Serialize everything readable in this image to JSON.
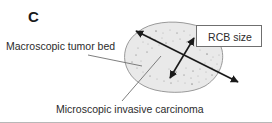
{
  "figure": {
    "panel_letter": "C",
    "labels": {
      "macroscopic": "Macroscopic tumor bed",
      "microscopic": "Microscopic invasive carcinoma",
      "rcb_size": "RCB size"
    },
    "colors": {
      "text": "#2b2b2b",
      "panel_letter": "#1a1a1a",
      "tumor_bed_fill": "#e8e8e8",
      "tumor_bed_stroke": "#9a9a9a",
      "arrow": "#1a1a1a",
      "leader_line": "#777777",
      "box_border": "#6f6f6f",
      "bottom_rule": "#b8b8b8",
      "background": "#ffffff",
      "speckle": "#8f8f8f"
    },
    "shapes": {
      "tumor_bed": {
        "name": "irregular-ellipse",
        "center_x": 174,
        "center_y": 57,
        "radius_x": 48,
        "radius_y": 35
      },
      "arrows": [
        {
          "name": "rcb-size-long-arrow",
          "double_headed": true,
          "x1": 136,
          "y1": 31,
          "x2": 238,
          "y2": 82
        },
        {
          "name": "rcb-size-short-arrow",
          "double_headed": true,
          "x1": 170,
          "y1": 78,
          "x2": 194,
          "y2": 38
        }
      ],
      "leader_lines": [
        {
          "name": "macroscopic-leader-line",
          "x1": 88,
          "y1": 55,
          "x2": 142,
          "y2": 66
        },
        {
          "name": "microscopic-leader-line",
          "x1": 122,
          "y1": 101,
          "x2": 161,
          "y2": 56
        }
      ],
      "speckles": [
        [
          156,
          31
        ],
        [
          163,
          33
        ],
        [
          170,
          30
        ],
        [
          177,
          33
        ],
        [
          184,
          31
        ],
        [
          190,
          35
        ],
        [
          150,
          37
        ],
        [
          143,
          42
        ],
        [
          138,
          48
        ],
        [
          136,
          55
        ],
        [
          141,
          61
        ],
        [
          148,
          44
        ],
        [
          155,
          40
        ],
        [
          162,
          38
        ],
        [
          186,
          68
        ],
        [
          193,
          71
        ],
        [
          200,
          69
        ],
        [
          206,
          72
        ],
        [
          212,
          68
        ],
        [
          198,
          76
        ],
        [
          191,
          78
        ],
        [
          184,
          75
        ],
        [
          205,
          63
        ],
        [
          211,
          60
        ],
        [
          176,
          72
        ],
        [
          169,
          69
        ],
        [
          217,
          64
        ],
        [
          147,
          52
        ],
        [
          152,
          48
        ],
        [
          159,
          45
        ],
        [
          166,
          43
        ],
        [
          173,
          41
        ],
        [
          180,
          39
        ],
        [
          187,
          42
        ],
        [
          194,
          46
        ],
        [
          200,
          50
        ],
        [
          207,
          54
        ],
        [
          213,
          57
        ],
        [
          219,
          55
        ],
        [
          132,
          62
        ],
        [
          137,
          68
        ],
        [
          143,
          72
        ],
        [
          150,
          76
        ],
        [
          157,
          79
        ],
        [
          164,
          81
        ],
        [
          171,
          83
        ],
        [
          178,
          81
        ],
        [
          185,
          83
        ],
        [
          192,
          84
        ],
        [
          199,
          82
        ],
        [
          206,
          79
        ],
        [
          212,
          75
        ],
        [
          218,
          70
        ]
      ]
    }
  }
}
